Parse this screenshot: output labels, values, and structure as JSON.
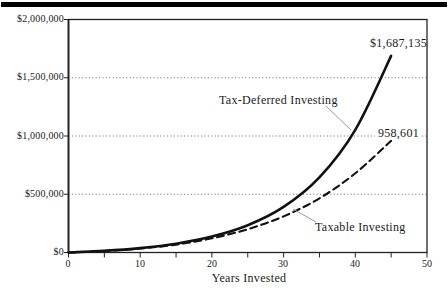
{
  "figure": {
    "background": "#ffffff",
    "top_rule_color": "#000000",
    "text_color": "#1a1a1a"
  },
  "chart_data": {
    "type": "line",
    "xlabel": "Years Invested",
    "ylabel": "",
    "xlim": [
      0,
      50
    ],
    "ylim": [
      0,
      2000000
    ],
    "x_tick_labels": [
      "0",
      "10",
      "20",
      "30",
      "40",
      "50"
    ],
    "x_minor_tick_step": 5,
    "y_tick_labels": [
      "$0",
      "$500,000",
      "$1,000,000",
      "$1,500,000",
      "$2,000,000"
    ],
    "grid": "dotted horizontal lines at $500,000 intervals",
    "legend_position": "inline annotations with leader lines",
    "x": [
      0,
      5,
      10,
      15,
      20,
      25,
      30,
      35,
      40,
      45
    ],
    "series": [
      {
        "name": "Tax-Deferred Investing",
        "style": "solid",
        "stroke": "#111111",
        "values": [
          0,
          14500,
          38000,
          75600,
          136300,
          234100,
          391500,
          645000,
          1053400,
          1687135
        ],
        "end_label": "$1,687,135"
      },
      {
        "name": "Taxable Investing",
        "style": "dashed",
        "stroke": "#111111",
        "values": [
          0,
          13000,
          34000,
          68000,
          122000,
          200000,
          310000,
          465000,
          680000,
          958601
        ],
        "end_label": "958,601"
      }
    ]
  }
}
